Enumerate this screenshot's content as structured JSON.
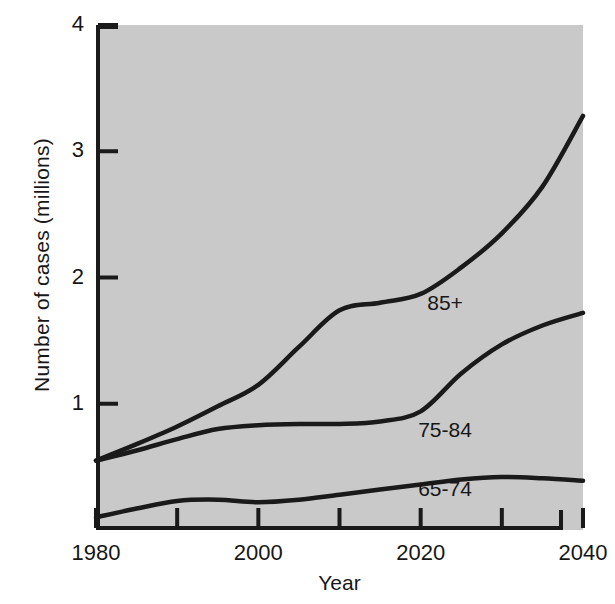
{
  "figure": {
    "background_color": "#ffffff",
    "plot_background_color": "#c9c9c9",
    "axis_color": "#1a1a1a",
    "line_color": "#1a1a1a"
  },
  "axis_titles": {
    "y": "Number of cases (millions)",
    "x": "Year"
  },
  "y_ticks": [
    {
      "label": "1",
      "value": 1
    },
    {
      "label": "2",
      "value": 2
    },
    {
      "label": "3",
      "value": 3
    },
    {
      "label": "4",
      "value": 4
    }
  ],
  "x_ticks": [
    {
      "label": "1980",
      "value": 1980,
      "major": true
    },
    {
      "label": "",
      "value": 1990,
      "major": false
    },
    {
      "label": "2000",
      "value": 2000,
      "major": true
    },
    {
      "label": "",
      "value": 2010,
      "major": false
    },
    {
      "label": "2020",
      "value": 2020,
      "major": true
    },
    {
      "label": "",
      "value": 2030,
      "major": false
    },
    {
      "label": "2040",
      "value": 2040,
      "major": true
    }
  ],
  "series_labels": {
    "s85plus": "85+",
    "s7584": "75-84",
    "s6574": "65-74"
  },
  "chart_data": {
    "type": "line",
    "title": "",
    "xlabel": "Year",
    "ylabel": "Number of cases (millions)",
    "xlim": [
      1980,
      2040
    ],
    "ylim": [
      0,
      4
    ],
    "grid": false,
    "legend": "inline-labels",
    "x": [
      1980,
      1985,
      1990,
      1995,
      2000,
      2005,
      2010,
      2015,
      2020,
      2025,
      2030,
      2035,
      2040
    ],
    "series": [
      {
        "name": "85+",
        "label_position": {
          "x": 2023,
          "y": 1.74
        },
        "values": [
          0.55,
          0.68,
          0.82,
          0.98,
          1.15,
          1.45,
          1.74,
          1.8,
          1.87,
          2.08,
          2.35,
          2.72,
          3.28
        ]
      },
      {
        "name": "75-84",
        "label_position": {
          "x": 2023,
          "y": 0.74
        },
        "values": [
          0.55,
          0.63,
          0.72,
          0.8,
          0.83,
          0.84,
          0.84,
          0.86,
          0.94,
          1.24,
          1.47,
          1.62,
          1.72
        ]
      },
      {
        "name": "65-74",
        "label_position": {
          "x": 2023,
          "y": 0.27
        },
        "values": [
          0.1,
          0.17,
          0.23,
          0.24,
          0.22,
          0.24,
          0.28,
          0.32,
          0.36,
          0.4,
          0.42,
          0.41,
          0.39
        ]
      }
    ]
  }
}
